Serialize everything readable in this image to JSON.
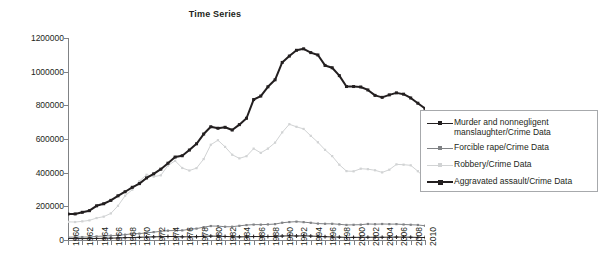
{
  "chart_data": {
    "type": "line",
    "title": "Time Series",
    "xlabel": "",
    "ylabel": "",
    "ylim": [
      0,
      1200000
    ],
    "ytick_values": [
      0,
      200000,
      400000,
      600000,
      800000,
      1000000,
      1200000
    ],
    "ytick_labels": [
      "0",
      "200000",
      "400000",
      "600000",
      "800000",
      "1000000",
      "1200000"
    ],
    "grid": false,
    "legend_position": "right",
    "x": [
      1960,
      1961,
      1962,
      1963,
      1964,
      1965,
      1966,
      1967,
      1968,
      1969,
      1970,
      1971,
      1972,
      1973,
      1974,
      1975,
      1976,
      1977,
      1978,
      1979,
      1980,
      1981,
      1982,
      1983,
      1984,
      1985,
      1986,
      1987,
      1988,
      1989,
      1990,
      1991,
      1992,
      1993,
      1994,
      1995,
      1996,
      1997,
      1998,
      1999,
      2000,
      2001,
      2002,
      2003,
      2004,
      2005,
      2006,
      2007,
      2008,
      2009,
      2010
    ],
    "xtick_labels": [
      "1960",
      "1962",
      "1964",
      "1966",
      "1968",
      "1970",
      "1972",
      "1974",
      "1976",
      "1978",
      "1980",
      "1982",
      "1984",
      "1986",
      "1988",
      "1990",
      "1992",
      "1994",
      "1996",
      "1998",
      "2000",
      "2002",
      "2004",
      "2006",
      "2008",
      "2010"
    ],
    "series": [
      {
        "name": "Murder and nonnegligent manslaughter/Crime Data",
        "color": "#231f20",
        "marker": "plus",
        "width": 1,
        "values": [
          9110,
          8740,
          8530,
          8640,
          9360,
          9960,
          11040,
          12240,
          13800,
          14760,
          16000,
          17780,
          18670,
          19640,
          20710,
          20510,
          18780,
          19120,
          19560,
          21460,
          23040,
          22520,
          21010,
          19308,
          18692,
          18976,
          20613,
          20096,
          20675,
          21500,
          23438,
          24703,
          23760,
          24526,
          23326,
          21606,
          19645,
          18208,
          16974,
          15522,
          15586,
          16037,
          16229,
          16528,
          16148,
          16740,
          17309,
          17128,
          16465,
          15399,
          14748
        ]
      },
      {
        "name": "Forcible rape/Crime Data",
        "color": "#808285",
        "marker": "square",
        "width": 1,
        "values": [
          17190,
          17220,
          17550,
          17650,
          21420,
          23410,
          25820,
          27620,
          31670,
          37170,
          37990,
          42260,
          46850,
          51400,
          55400,
          56090,
          57080,
          63500,
          67610,
          76390,
          82990,
          82500,
          78770,
          78918,
          84233,
          88671,
          91459,
          91111,
          92486,
          94504,
          102555,
          106593,
          109062,
          106014,
          102216,
          97470,
          96252,
          96153,
          93144,
          89411,
          90178,
          90863,
          95235,
          93883,
          95089,
          94347,
          94472,
          92160,
          90479,
          89241,
          84767
        ]
      },
      {
        "name": "Robbery/Crime Data",
        "color": "#d1d3d4",
        "marker": "square",
        "width": 1,
        "values": [
          107840,
          106670,
          110860,
          116470,
          130390,
          138690,
          157990,
          202910,
          262840,
          298850,
          349860,
          387700,
          376290,
          384220,
          442400,
          470500,
          427810,
          412610,
          426930,
          480700,
          565840,
          592910,
          553130,
          506567,
          485008,
          497874,
          542775,
          517704,
          542968,
          578326,
          639271,
          687732,
          672478,
          659870,
          618949,
          580509,
          535594,
          498534,
          447186,
          409371,
          408016,
          423557,
          420806,
          414235,
          401470,
          417438,
          449246,
          447324,
          443574,
          408742,
          367832
        ]
      },
      {
        "name": "Aggravated assault/Crime Data",
        "color": "#231f20",
        "marker": "square",
        "width": 2,
        "values": [
          154320,
          154860,
          164570,
          174210,
          203050,
          215330,
          235330,
          262600,
          286700,
          313090,
          334970,
          368760,
          393090,
          420650,
          456210,
          492620,
          500530,
          534350,
          571460,
          629480,
          672650,
          663900,
          669480,
          653294,
          685349,
          723246,
          834322,
          855088,
          910092,
          951707,
          1054863,
          1092739,
          1126974,
          1135607,
          1113179,
          1099207,
          1037049,
          1023201,
          976583,
          911740,
          911706,
          909023,
          891407,
          859030,
          847381,
          862220,
          874096,
          866358,
          843683,
          812514,
          781844
        ]
      }
    ]
  },
  "legend": {
    "entries": [
      {
        "label": "Murder and nonnegligent manslaughter/Crime Data"
      },
      {
        "label": "Forcible rape/Crime Data"
      },
      {
        "label": "Robbery/Crime Data"
      },
      {
        "label": "Aggravated assault/Crime Data"
      }
    ]
  }
}
